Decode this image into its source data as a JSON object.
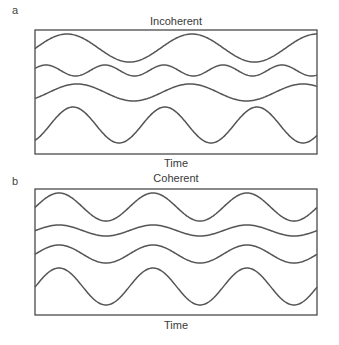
{
  "panels": [
    {
      "label": "a",
      "title": "Incoherent",
      "xlabel": "Time",
      "box": {
        "x": 35,
        "y": 30,
        "w": 282,
        "h": 124
      },
      "label_pos": {
        "x": 12,
        "y": 4
      },
      "title_pos": {
        "x": 116,
        "y": 15
      },
      "xlabel_pos": {
        "x": 136,
        "y": 157
      },
      "waves": [
        {
          "name": "wave-1",
          "center": 48,
          "amplitude": 14,
          "period": 125,
          "peak_x": 67
        },
        {
          "name": "wave-2",
          "center": 70.5,
          "amplitude": 5.5,
          "period": 59,
          "peak_x": 46
        },
        {
          "name": "wave-3",
          "center": 92.5,
          "amplitude": 8.5,
          "period": 113,
          "peak_x": 77
        },
        {
          "name": "wave-4",
          "center": 125,
          "amplitude": 18,
          "period": 92,
          "peak_x": 73
        }
      ]
    },
    {
      "label": "b",
      "title": "Coherent",
      "xlabel": "Time",
      "box": {
        "x": 35,
        "y": 189,
        "w": 282,
        "h": 126
      },
      "label_pos": {
        "x": 12,
        "y": 175
      },
      "title_pos": {
        "x": 116,
        "y": 172
      },
      "xlabel_pos": {
        "x": 136,
        "y": 319
      },
      "waves": [
        {
          "name": "wave-1",
          "center": 207,
          "amplitude": 14,
          "period": 94,
          "peak_x": 59
        },
        {
          "name": "wave-2",
          "center": 230.5,
          "amplitude": 5.5,
          "period": 94,
          "peak_x": 59
        },
        {
          "name": "wave-3",
          "center": 254,
          "amplitude": 9,
          "period": 94,
          "peak_x": 59
        },
        {
          "name": "wave-4",
          "center": 286.5,
          "amplitude": 18.5,
          "period": 94,
          "peak_x": 59
        }
      ]
    }
  ],
  "colors": {
    "line": "#555555",
    "box": "#4a4a4a",
    "text": "#3a3a3a"
  }
}
